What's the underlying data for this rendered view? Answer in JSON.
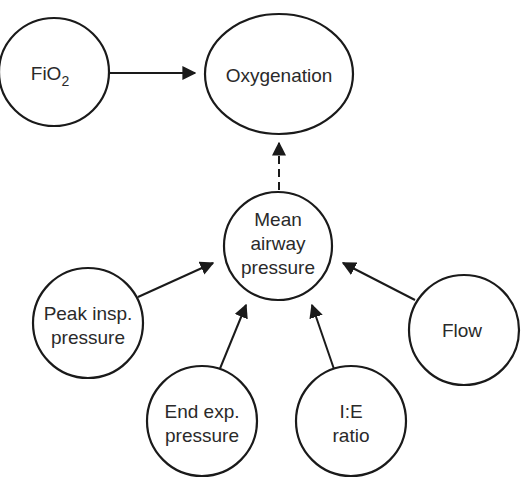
{
  "diagram": {
    "nodes": {
      "fio2": {
        "label": "FiO",
        "sub": "2"
      },
      "oxygenation": {
        "label": "Oxygenation"
      },
      "mean_airway": {
        "line1": "Mean",
        "line2": "airway",
        "line3": "pressure"
      },
      "peak_insp": {
        "line1": "Peak insp.",
        "line2": "pressure"
      },
      "end_exp": {
        "line1": "End exp.",
        "line2": "pressure"
      },
      "ie_ratio": {
        "line1": "I:E",
        "line2": "ratio"
      },
      "flow": {
        "label": "Flow"
      }
    },
    "edges": [
      {
        "from": "FiO2",
        "to": "Oxygenation",
        "style": "solid"
      },
      {
        "from": "Mean airway pressure",
        "to": "Oxygenation",
        "style": "dashed"
      },
      {
        "from": "Peak insp. pressure",
        "to": "Mean airway pressure",
        "style": "solid"
      },
      {
        "from": "End exp. pressure",
        "to": "Mean airway pressure",
        "style": "solid"
      },
      {
        "from": "I:E ratio",
        "to": "Mean airway pressure",
        "style": "solid"
      },
      {
        "from": "Flow",
        "to": "Mean airway pressure",
        "style": "solid"
      }
    ],
    "colors": {
      "stroke": "#1a1a1a",
      "fill": "#ffffff",
      "text": "#2a2a2a"
    }
  }
}
